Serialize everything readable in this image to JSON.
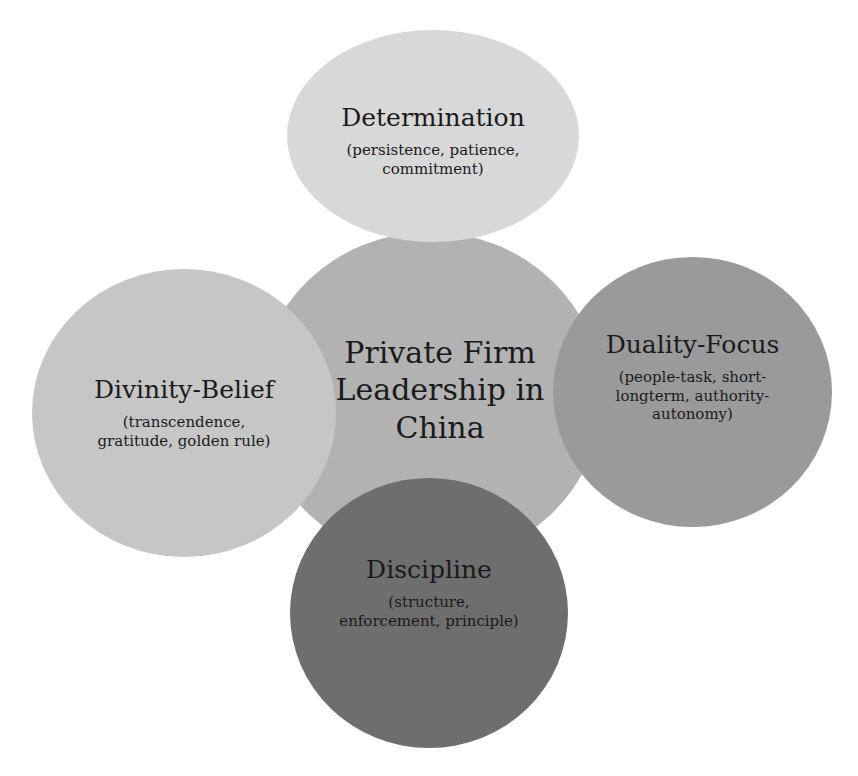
{
  "diagram": {
    "type": "cluster",
    "center": {
      "label": "Private Firm Leadership in China",
      "lines": [
        "Private Firm",
        "Leadership in",
        "China"
      ],
      "color": "#b2b2b2"
    },
    "nodes": [
      {
        "id": "top",
        "title": "Determination",
        "sub_lines": [
          "(persistence, patience,",
          "commitment)"
        ],
        "color": "#d6d6d6"
      },
      {
        "id": "left",
        "title": "Divinity-Belief",
        "sub_lines": [
          "(transcendence,",
          "gratitude, golden rule)"
        ],
        "color": "#c4c4c4"
      },
      {
        "id": "right",
        "title": "Duality-Focus",
        "sub_lines": [
          "(people-task, short-",
          "longterm, authority-",
          "autonomy)"
        ],
        "color": "#999999"
      },
      {
        "id": "bottom",
        "title": "Discipline",
        "sub_lines": [
          "(structure,",
          "enforcement, principle)"
        ],
        "color": "#6c6c6c"
      }
    ]
  }
}
